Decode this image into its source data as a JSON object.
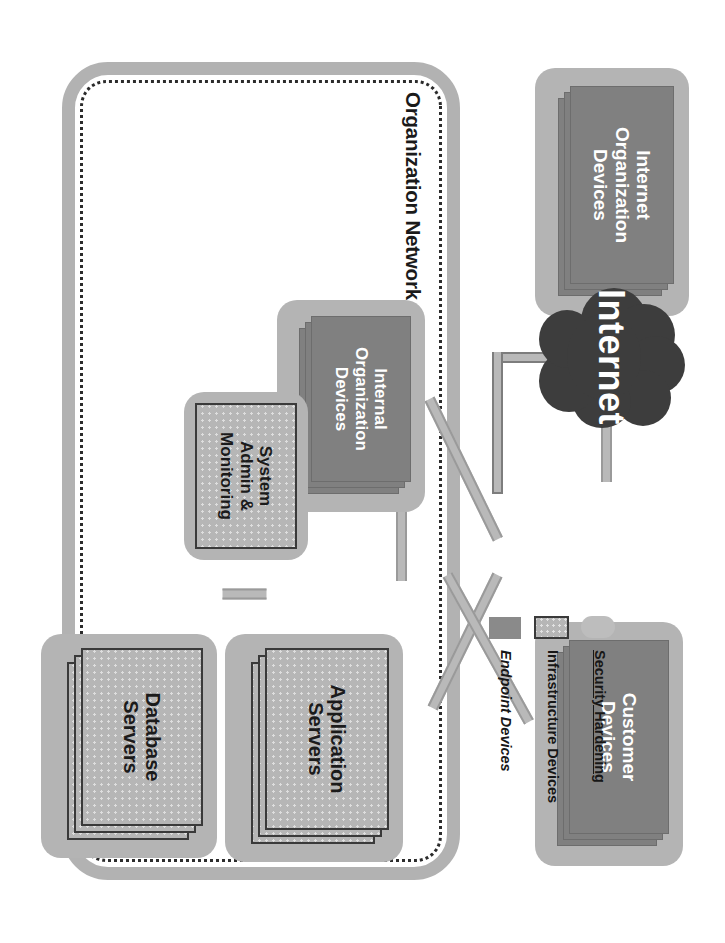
{
  "diagram": {
    "type": "network-architecture"
  },
  "containers": {
    "org_network": {
      "label": "Organization Network",
      "border_color": "#b2b2b2",
      "dotted_border_color": "#2b2b2b"
    }
  },
  "nodes": {
    "internet_org_devices": {
      "label": "Internet\nOrganization\nDevices",
      "line1": "Internet",
      "line2": "Organization",
      "line3": "Devices",
      "kind": "endpoint",
      "stacked": true,
      "hardened": true,
      "color": "#808080"
    },
    "customer_devices": {
      "label": "Customer\nDevices",
      "line1": "Customer",
      "line2": "Devices",
      "kind": "endpoint",
      "stacked": true,
      "hardened": true,
      "color": "#808080"
    },
    "internet": {
      "label": "Internet",
      "kind": "cloud",
      "color": "#3d3d3d"
    },
    "internal_org_devices": {
      "label": "Internal\nOrganization\nDevices",
      "line1": "Internal",
      "line2": "Organization",
      "line3": "Devices",
      "kind": "endpoint",
      "stacked": true,
      "hardened": true,
      "color": "#808080"
    },
    "system_admin": {
      "label": "System\nAdmin &\nMonitoring",
      "line1": "System",
      "line2": "Admin &",
      "line3": "Monitoring",
      "kind": "infrastructure",
      "stacked": false,
      "hardened": true,
      "color": "#b6b6b6"
    },
    "application_servers": {
      "label": "Application\nServers",
      "line1": "Application",
      "line2": "Servers",
      "kind": "infrastructure",
      "stacked": true,
      "hardened": true,
      "color": "#b6b6b6"
    },
    "database_servers": {
      "label": "Database\nServers",
      "line1": "Database",
      "line2": "Servers",
      "kind": "infrastructure",
      "stacked": true,
      "hardened": true,
      "color": "#b6b6b6"
    }
  },
  "links": [
    {
      "from": "internet_org_devices",
      "to": "internet",
      "style": "straight"
    },
    {
      "from": "internet",
      "to": "customer_devices",
      "style": "straight"
    },
    {
      "from": "internet",
      "to": "application_servers",
      "style": "elbow"
    },
    {
      "from": "internal_org_devices",
      "to": "application_servers",
      "style": "straight"
    },
    {
      "from": "internal_org_devices",
      "to": "system_admin",
      "style": "diagonal"
    },
    {
      "from": "system_admin",
      "to": "application_servers",
      "style": "diagonal"
    },
    {
      "from": "system_admin",
      "to": "database_servers",
      "style": "diagonal"
    },
    {
      "from": "application_servers",
      "to": "database_servers",
      "style": "straight"
    }
  ],
  "legend": {
    "items": [
      {
        "label": "Security Hardening",
        "swatch": "rounded-light-gray",
        "color": "#bdbdbd"
      },
      {
        "label": "Infrastructure Devices",
        "swatch": "dotted-bordered-gray",
        "color": "#b6b6b6"
      },
      {
        "label": "Endpoint Devices",
        "swatch": "solid-dark-gray",
        "color": "#8a8a8a"
      }
    ]
  }
}
